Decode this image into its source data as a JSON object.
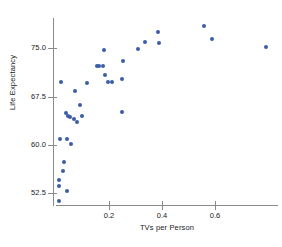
{
  "chart_data": {
    "type": "scatter",
    "title": "",
    "xlabel": "TVs per Person",
    "ylabel": "Life Expectancy",
    "xlim": [
      0.0,
      0.837
    ],
    "ylim": [
      50.7,
      79.7
    ],
    "xticks": [
      0.2,
      0.4,
      0.6
    ],
    "xtick_labels": [
      "0.2",
      "0.4",
      "0.6"
    ],
    "yticks": [
      52.5,
      60.0,
      67.5,
      75.0
    ],
    "ytick_labels": [
      "52.5",
      "60.0",
      "67.5",
      "75.0"
    ],
    "grid": false,
    "legend": null,
    "marker_color": "#3a5ea8",
    "axis_color": "#8a8a8a",
    "series": [
      {
        "name": "Countries",
        "points": [
          {
            "x": 0.012,
            "y": 51.3
          },
          {
            "x": 0.01,
            "y": 54.6
          },
          {
            "x": 0.011,
            "y": 53.6
          },
          {
            "x": 0.03,
            "y": 57.3
          },
          {
            "x": 0.027,
            "y": 55.9
          },
          {
            "x": 0.043,
            "y": 52.8
          },
          {
            "x": 0.014,
            "y": 60.9
          },
          {
            "x": 0.041,
            "y": 60.9
          },
          {
            "x": 0.057,
            "y": 60.2
          },
          {
            "x": 0.019,
            "y": 69.7
          },
          {
            "x": 0.038,
            "y": 64.9
          },
          {
            "x": 0.046,
            "y": 64.5
          },
          {
            "x": 0.053,
            "y": 64.4
          },
          {
            "x": 0.068,
            "y": 64.1
          },
          {
            "x": 0.079,
            "y": 63.6
          },
          {
            "x": 0.098,
            "y": 64.5
          },
          {
            "x": 0.072,
            "y": 68.4
          },
          {
            "x": 0.091,
            "y": 66.2
          },
          {
            "x": 0.118,
            "y": 69.6
          },
          {
            "x": 0.156,
            "y": 72.3
          },
          {
            "x": 0.163,
            "y": 72.3
          },
          {
            "x": 0.178,
            "y": 72.2
          },
          {
            "x": 0.182,
            "y": 74.7
          },
          {
            "x": 0.186,
            "y": 70.9
          },
          {
            "x": 0.197,
            "y": 69.7
          },
          {
            "x": 0.213,
            "y": 69.7
          },
          {
            "x": 0.25,
            "y": 70.3
          },
          {
            "x": 0.252,
            "y": 73.1
          },
          {
            "x": 0.25,
            "y": 65.2
          },
          {
            "x": 0.31,
            "y": 74.9
          },
          {
            "x": 0.337,
            "y": 76.0
          },
          {
            "x": 0.387,
            "y": 75.9
          },
          {
            "x": 0.383,
            "y": 77.5
          },
          {
            "x": 0.558,
            "y": 78.5
          },
          {
            "x": 0.587,
            "y": 76.4
          },
          {
            "x": 0.79,
            "y": 75.2
          }
        ]
      }
    ]
  }
}
